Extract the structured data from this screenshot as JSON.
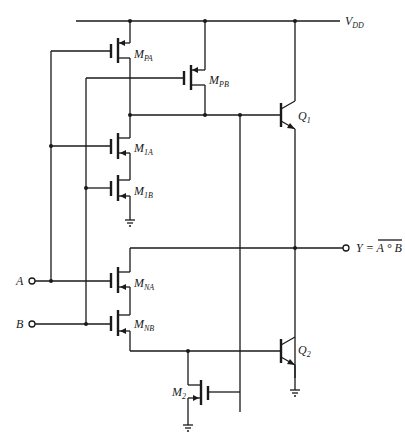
{
  "diagram": {
    "type": "BiCMOS NAND gate schematic",
    "supply_label": "V",
    "supply_sub": "DD",
    "inputs": [
      {
        "label": "A"
      },
      {
        "label": "B"
      }
    ],
    "output": {
      "prefix": "Y = ",
      "expr": "A ° B"
    },
    "transistors": [
      {
        "id": "MPA",
        "main": "M",
        "sub": "PA",
        "type": "PMOS"
      },
      {
        "id": "MPB",
        "main": "M",
        "sub": "PB",
        "type": "PMOS"
      },
      {
        "id": "M1A",
        "main": "M",
        "sub": "1A",
        "type": "NMOS"
      },
      {
        "id": "M1B",
        "main": "M",
        "sub": "1B",
        "type": "NMOS"
      },
      {
        "id": "MNA",
        "main": "M",
        "sub": "NA",
        "type": "NMOS"
      },
      {
        "id": "MNB",
        "main": "M",
        "sub": "NB",
        "type": "NMOS"
      },
      {
        "id": "M2",
        "main": "M",
        "sub": "2",
        "type": "NMOS"
      },
      {
        "id": "Q1",
        "main": "Q",
        "sub": "1",
        "type": "NPN"
      },
      {
        "id": "Q2",
        "main": "Q",
        "sub": "2",
        "type": "NPN"
      }
    ]
  }
}
